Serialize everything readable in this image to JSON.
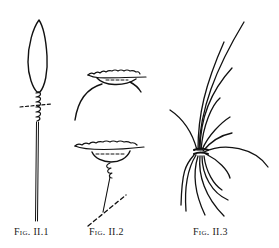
{
  "figures": [
    {
      "id": "fig-ii-1",
      "caption": "Fig. II.1",
      "subject": "spindle-shaped leaf bound with coil on stem"
    },
    {
      "id": "fig-ii-2",
      "caption": "Fig. II.2",
      "subject": "cup-shaped forms with stem and dashed line"
    },
    {
      "id": "fig-ii-3",
      "caption": "Fig. II.3",
      "subject": "bundle of long fibres tied at a knot"
    }
  ],
  "colors": {
    "ink": "#111111",
    "background": "#ffffff"
  }
}
